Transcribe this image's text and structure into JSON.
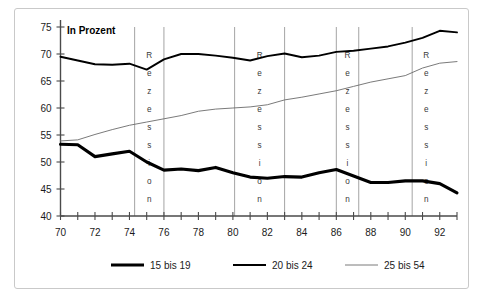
{
  "figure": {
    "units_label": "In Prozent",
    "recession_label": "Rezession"
  },
  "legend": {
    "items": [
      {
        "label": "15 bis 19",
        "color": "#000000",
        "width": 3.1
      },
      {
        "label": "20 bis 24",
        "color": "#000000",
        "width": 1.9
      },
      {
        "label": "25 bis 54",
        "color": "#6b6b6b",
        "width": 0.9
      }
    ]
  },
  "axes": {
    "y_ticks": [
      40,
      45,
      50,
      55,
      60,
      65,
      70,
      75
    ],
    "x_ticks": [
      70,
      71,
      72,
      73,
      74,
      75,
      76,
      77,
      78,
      79,
      80,
      81,
      82,
      83,
      84,
      85,
      86,
      87,
      88,
      89,
      90,
      91,
      92,
      93
    ],
    "x_tick_labels": [
      70,
      72,
      74,
      76,
      78,
      80,
      82,
      84,
      86,
      88,
      90,
      92
    ]
  },
  "chart_data": {
    "type": "line",
    "title": "",
    "subtitle": "",
    "xlabel": "",
    "ylabel": "In Prozent",
    "xlim": [
      70,
      93
    ],
    "ylim": [
      40,
      75
    ],
    "grid": false,
    "legend_position": "bottom",
    "x": [
      70,
      71,
      72,
      73,
      74,
      75,
      76,
      77,
      78,
      79,
      80,
      81,
      82,
      83,
      84,
      85,
      86,
      87,
      88,
      89,
      90,
      91,
      92,
      93
    ],
    "series": [
      {
        "name": "15 bis 19",
        "color": "#000000",
        "linewidth": 3.1,
        "values": [
          53.3,
          53.2,
          51.0,
          51.5,
          52.0,
          50.0,
          48.5,
          48.7,
          48.4,
          49.0,
          48.0,
          47.2,
          47.0,
          47.3,
          47.2,
          48.0,
          48.6,
          47.4,
          46.2,
          46.2,
          46.5,
          46.5,
          46.0,
          44.3
        ]
      },
      {
        "name": "20 bis 24",
        "color": "#000000",
        "linewidth": 1.9,
        "values": [
          69.5,
          68.8,
          68.1,
          68.0,
          68.2,
          67.1,
          69.0,
          70.0,
          70.0,
          69.7,
          69.3,
          68.8,
          69.6,
          70.1,
          69.4,
          69.7,
          70.4,
          70.6,
          71.0,
          71.4,
          72.1,
          73.0,
          74.3,
          74.0
        ]
      },
      {
        "name": "25 bis 54",
        "color": "#6b6b6b",
        "linewidth": 0.9,
        "values": [
          53.9,
          54.1,
          55.1,
          56.0,
          56.8,
          57.4,
          58.0,
          58.6,
          59.4,
          59.8,
          60.0,
          60.2,
          60.6,
          61.5,
          62.0,
          62.6,
          63.2,
          64.0,
          64.8,
          65.4,
          66.0,
          67.4,
          68.3,
          68.6
        ]
      }
    ],
    "annotations": [
      {
        "label": "Rezession",
        "x_start": 74.3,
        "x_end": 76.0
      },
      {
        "label": "Rezession",
        "x_start": 80.1,
        "x_end": 83.0
      },
      {
        "label": "Rezession",
        "x_start": 86.0,
        "x_end": 87.3
      },
      {
        "label": "Rezession",
        "x_start": 90.4,
        "x_end": 93.0
      }
    ]
  }
}
